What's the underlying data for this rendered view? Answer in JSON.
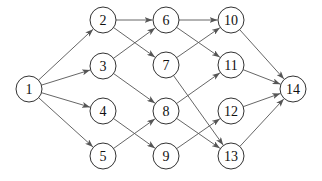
{
  "diagram": {
    "type": "directed-graph",
    "colors": {
      "edge": "#555555",
      "node_stroke": "#333333",
      "node_fill": "#ffffff",
      "text": "#111111"
    },
    "node_radius": 13,
    "nodes": [
      {
        "id": "1",
        "label": "1",
        "x": 29,
        "y": 89
      },
      {
        "id": "2",
        "label": "2",
        "x": 103,
        "y": 20
      },
      {
        "id": "3",
        "label": "3",
        "x": 103,
        "y": 66
      },
      {
        "id": "4",
        "label": "4",
        "x": 103,
        "y": 111
      },
      {
        "id": "5",
        "label": "5",
        "x": 103,
        "y": 156
      },
      {
        "id": "6",
        "label": "6",
        "x": 166,
        "y": 20
      },
      {
        "id": "7",
        "label": "7",
        "x": 166,
        "y": 65
      },
      {
        "id": "8",
        "label": "8",
        "x": 166,
        "y": 111
      },
      {
        "id": "9",
        "label": "9",
        "x": 166,
        "y": 156
      },
      {
        "id": "10",
        "label": "10",
        "x": 231,
        "y": 20
      },
      {
        "id": "11",
        "label": "11",
        "x": 231,
        "y": 65
      },
      {
        "id": "12",
        "label": "12",
        "x": 231,
        "y": 111
      },
      {
        "id": "13",
        "label": "13",
        "x": 231,
        "y": 156
      },
      {
        "id": "14",
        "label": "14",
        "x": 293,
        "y": 89
      }
    ],
    "edges": [
      {
        "from": "1",
        "to": "2"
      },
      {
        "from": "1",
        "to": "3"
      },
      {
        "from": "1",
        "to": "4"
      },
      {
        "from": "1",
        "to": "5"
      },
      {
        "from": "2",
        "to": "6"
      },
      {
        "from": "2",
        "to": "7"
      },
      {
        "from": "3",
        "to": "6"
      },
      {
        "from": "3",
        "to": "8"
      },
      {
        "from": "4",
        "to": "9"
      },
      {
        "from": "5",
        "to": "8"
      },
      {
        "from": "6",
        "to": "10"
      },
      {
        "from": "6",
        "to": "11"
      },
      {
        "from": "7",
        "to": "10"
      },
      {
        "from": "7",
        "to": "13"
      },
      {
        "from": "8",
        "to": "11"
      },
      {
        "from": "8",
        "to": "13"
      },
      {
        "from": "9",
        "to": "12"
      },
      {
        "from": "10",
        "to": "14"
      },
      {
        "from": "11",
        "to": "14"
      },
      {
        "from": "12",
        "to": "14"
      },
      {
        "from": "13",
        "to": "14"
      }
    ]
  }
}
